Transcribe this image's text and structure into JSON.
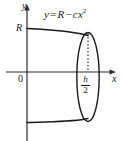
{
  "figure": {
    "background_color": "#ffffff",
    "stroke_color": "#1a1a1a",
    "axes": {
      "x_label": "x",
      "y_label": "y",
      "origin_label": "0",
      "x_axis_y_px": 72,
      "y_axis_x_px": 27,
      "x_axis_end_px": 115,
      "y_axis_top_px": 5
    },
    "labels": {
      "equation_y": "y",
      "equation_equals": "=",
      "equation_R": "R",
      "equation_minus": "−",
      "equation_c": "c",
      "equation_x": "x",
      "equation_exponent": "2",
      "equation_full": "y = R − cx²",
      "radius_label": "R",
      "half_height_numerator": "h",
      "half_height_denominator": "2",
      "half_height_full": "h/2"
    },
    "geometry": {
      "curve_top_start": [
        27,
        29
      ],
      "curve_top_end": [
        88,
        36
      ],
      "curve_bottom_start": [
        27,
        122
      ],
      "curve_bottom_end": [
        88,
        118
      ],
      "ellipse_center": [
        88,
        77
      ],
      "ellipse_rx": 11,
      "ellipse_ry": 45,
      "dashed_line_from": [
        88,
        34
      ],
      "dashed_line_to": [
        88,
        72
      ]
    }
  }
}
